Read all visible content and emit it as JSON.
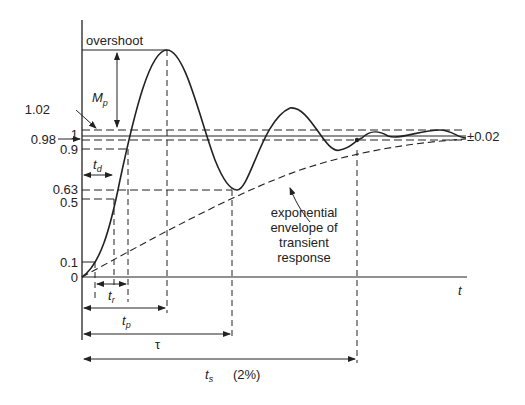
{
  "diagram": {
    "y_ticks": [
      {
        "label": "1.02",
        "value": 1.02
      },
      {
        "label": "1",
        "value": 1.0
      },
      {
        "label": "0.98",
        "value": 0.98
      },
      {
        "label": "0.9",
        "value": 0.9
      },
      {
        "label": "0.63",
        "value": 0.63
      },
      {
        "label": "0.5",
        "value": 0.5
      },
      {
        "label": "0.1",
        "value": 0.1
      },
      {
        "label": "0",
        "value": 0
      }
    ],
    "x_axis_label": "t",
    "overshoot_label": "overshoot",
    "mp_label": "M",
    "mp_sub": "p",
    "td_label": "t",
    "td_sub": "d",
    "tr_label": "t",
    "tr_sub": "r",
    "tp_label": "t",
    "tp_sub": "p",
    "tau_label": "τ",
    "ts_label": "t",
    "ts_sub": "s",
    "ts_note": "(2%)",
    "tolerance_label": "±0.02",
    "envelope_note": [
      "exponential",
      "envelope of",
      "transient",
      "response"
    ]
  }
}
